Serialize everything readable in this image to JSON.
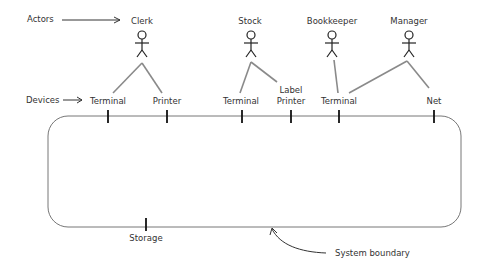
{
  "labels": {
    "actors": "Actors",
    "devices": "Devices",
    "system_boundary": "System boundary"
  },
  "actors": [
    {
      "name": "Clerk"
    },
    {
      "name": "Stock"
    },
    {
      "name": "Bookkeeper"
    },
    {
      "name": "Manager"
    }
  ],
  "devices": [
    {
      "line1": "",
      "line2": "Terminal"
    },
    {
      "line1": "",
      "line2": "Printer"
    },
    {
      "line1": "",
      "line2": "Terminal"
    },
    {
      "line1": "Label",
      "line2": "Printer"
    },
    {
      "line1": "",
      "line2": "Terminal"
    },
    {
      "line1": "",
      "line2": "Net"
    }
  ],
  "storage": {
    "label": "Storage"
  },
  "connections": [
    {
      "actor": "Clerk",
      "device_index": 0
    },
    {
      "actor": "Clerk",
      "device_index": 1
    },
    {
      "actor": "Stock",
      "device_index": 2
    },
    {
      "actor": "Stock",
      "device_index": 3
    },
    {
      "actor": "Bookkeeper",
      "device_index": 4
    },
    {
      "actor": "Manager",
      "device_index": 4
    },
    {
      "actor": "Manager",
      "device_index": 5
    }
  ]
}
